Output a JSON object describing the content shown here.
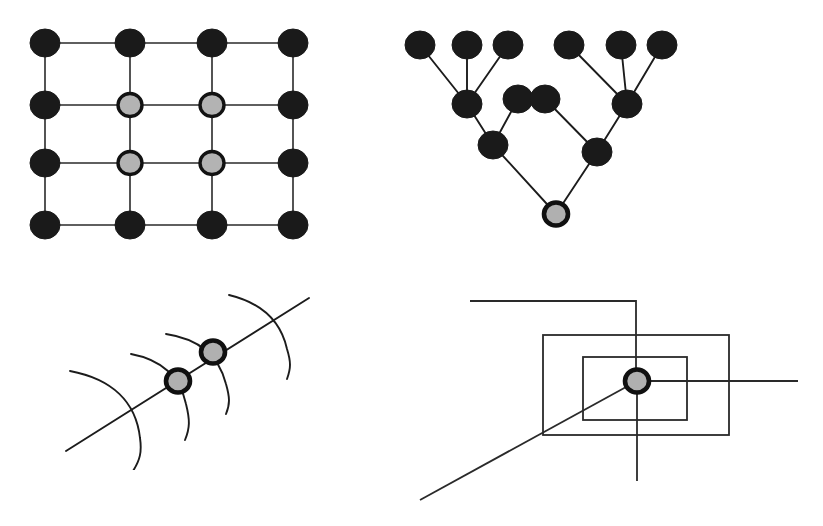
{
  "figure": {
    "canvas": {
      "width": 823,
      "height": 526
    },
    "colors": {
      "background": "#ffffff",
      "node_dark": "#1a1a1a",
      "node_light_fill": "#b3b3b3",
      "node_ring": "#121212",
      "edge": "#1c1c1c",
      "rect": "#2a2a2a"
    }
  },
  "panels": [
    {
      "id": "grid-lattice",
      "name": "Top-left 4x4 grid lattice",
      "caption": "",
      "origin": {
        "x": 0,
        "y": 0
      },
      "size": {
        "width": 340,
        "height": 270
      },
      "columns_x": [
        45,
        130,
        212,
        293
      ],
      "rows_y": [
        43,
        105,
        163,
        225
      ],
      "node_radius_dark": 14,
      "node_radius_light": 12,
      "nodes": [
        {
          "col": 0,
          "row": 0,
          "type": "dark"
        },
        {
          "col": 1,
          "row": 0,
          "type": "dark"
        },
        {
          "col": 2,
          "row": 0,
          "type": "dark"
        },
        {
          "col": 3,
          "row": 0,
          "type": "dark"
        },
        {
          "col": 0,
          "row": 1,
          "type": "dark"
        },
        {
          "col": 1,
          "row": 1,
          "type": "light"
        },
        {
          "col": 2,
          "row": 1,
          "type": "light"
        },
        {
          "col": 3,
          "row": 1,
          "type": "dark"
        },
        {
          "col": 0,
          "row": 2,
          "type": "dark"
        },
        {
          "col": 1,
          "row": 2,
          "type": "light"
        },
        {
          "col": 2,
          "row": 2,
          "type": "light"
        },
        {
          "col": 3,
          "row": 2,
          "type": "dark"
        },
        {
          "col": 0,
          "row": 3,
          "type": "dark"
        },
        {
          "col": 1,
          "row": 3,
          "type": "dark"
        },
        {
          "col": 2,
          "row": 3,
          "type": "dark"
        },
        {
          "col": 3,
          "row": 3,
          "type": "dark"
        }
      ],
      "edge_count": 24,
      "light_node_count": 4,
      "dark_node_count": 12
    },
    {
      "id": "hierarchy-tree",
      "name": "Top-right hierarchical tree",
      "caption": "",
      "origin": {
        "x": 390,
        "y": 20
      },
      "size": {
        "width": 330,
        "height": 230
      },
      "node_radius_dark": 14,
      "node_radius_light": 13,
      "nodes": [
        {
          "id": "L1",
          "x": 420,
          "y": 45,
          "type": "dark",
          "level": "leaf"
        },
        {
          "id": "L2",
          "x": 467,
          "y": 45,
          "type": "dark",
          "level": "leaf"
        },
        {
          "id": "L3",
          "x": 508,
          "y": 45,
          "type": "dark",
          "level": "leaf"
        },
        {
          "id": "L4",
          "x": 569,
          "y": 45,
          "type": "dark",
          "level": "leaf"
        },
        {
          "id": "L5",
          "x": 621,
          "y": 45,
          "type": "dark",
          "level": "leaf"
        },
        {
          "id": "L6",
          "x": 662,
          "y": 45,
          "type": "dark",
          "level": "leaf"
        },
        {
          "id": "M1",
          "x": 467,
          "y": 104,
          "type": "dark",
          "level": "mid"
        },
        {
          "id": "M2",
          "x": 518,
          "y": 99,
          "type": "dark",
          "level": "mid"
        },
        {
          "id": "M3",
          "x": 545,
          "y": 99,
          "type": "dark",
          "level": "mid"
        },
        {
          "id": "M4",
          "x": 627,
          "y": 104,
          "type": "dark",
          "level": "mid"
        },
        {
          "id": "N1",
          "x": 493,
          "y": 145,
          "type": "dark",
          "level": "inner"
        },
        {
          "id": "N2",
          "x": 597,
          "y": 152,
          "type": "dark",
          "level": "inner"
        },
        {
          "id": "R",
          "x": 556,
          "y": 214,
          "type": "light",
          "level": "root"
        }
      ],
      "edges": [
        [
          "L1",
          "M1"
        ],
        [
          "L2",
          "M1"
        ],
        [
          "L3",
          "M1"
        ],
        [
          "L4",
          "M4"
        ],
        [
          "L5",
          "M4"
        ],
        [
          "L6",
          "M4"
        ],
        [
          "M1",
          "N1"
        ],
        [
          "M2",
          "N1"
        ],
        [
          "M3",
          "N2"
        ],
        [
          "M4",
          "N2"
        ],
        [
          "N1",
          "R"
        ],
        [
          "N2",
          "R"
        ]
      ],
      "leaf_count": 6,
      "light_node_count": 1
    },
    {
      "id": "level-set-curves",
      "name": "Bottom-left level-set curves with two marked nodes",
      "caption": "",
      "origin": {
        "x": 50,
        "y": 280
      },
      "size": {
        "width": 290,
        "height": 190
      },
      "nodes": [
        {
          "id": "P1",
          "x": 178,
          "y": 381,
          "type": "light",
          "radius": 13
        },
        {
          "id": "P2",
          "x": 213,
          "y": 352,
          "type": "light",
          "radius": 13
        }
      ],
      "straight_lines": [
        {
          "from": {
            "x": 66,
            "y": 451
          },
          "to": {
            "x": 309,
            "y": 298
          }
        }
      ],
      "curve_count": 4,
      "light_node_count": 2
    },
    {
      "id": "nested-boxes",
      "name": "Bottom-right nested rectangles with crossing lines",
      "caption": "",
      "origin": {
        "x": 380,
        "y": 280
      },
      "size": {
        "width": 420,
        "height": 240
      },
      "nodes": [
        {
          "id": "C",
          "x": 637,
          "y": 381,
          "type": "light",
          "radius": 13
        }
      ],
      "rectangles": [
        {
          "id": "outer",
          "x": 543,
          "y": 335,
          "width": 186,
          "height": 100
        },
        {
          "id": "inner",
          "x": 583,
          "y": 357,
          "width": 104,
          "height": 63
        }
      ],
      "polylines": [
        {
          "id": "outer-hook",
          "points": "470,301 636,301 636,381"
        }
      ],
      "straight_lines": [
        {
          "id": "horizontal-right",
          "from": {
            "x": 637,
            "y": 381
          },
          "to": {
            "x": 798,
            "y": 381
          }
        },
        {
          "id": "vertical-down",
          "from": {
            "x": 637,
            "y": 381
          },
          "to": {
            "x": 637,
            "y": 481
          }
        },
        {
          "id": "diagonal",
          "from": {
            "x": 420,
            "y": 500
          },
          "to": {
            "x": 637,
            "y": 381
          }
        }
      ],
      "rect_count": 2,
      "light_node_count": 1
    }
  ]
}
